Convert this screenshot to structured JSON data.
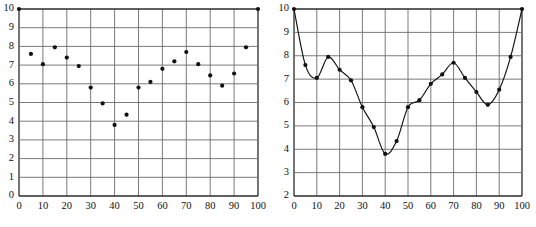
{
  "figure": {
    "title": "",
    "panel_count": 2
  },
  "chart_data": [
    {
      "id": "left-scatter",
      "type": "scatter",
      "title": "",
      "xlabel": "",
      "ylabel": "",
      "xlim": [
        0,
        100
      ],
      "ylim": [
        0,
        10
      ],
      "grid": true,
      "legend": false,
      "xticks": [
        0,
        10,
        20,
        30,
        40,
        50,
        60,
        70,
        80,
        90,
        100
      ],
      "yticks": [
        0,
        1,
        2,
        3,
        4,
        5,
        6,
        7,
        8,
        9,
        10
      ],
      "xticklabels": [
        "0",
        "10",
        "20",
        "30",
        "40",
        "50",
        "60",
        "70",
        "80",
        "90",
        "100"
      ],
      "yticklabels": [
        "0",
        "1",
        "2",
        "3",
        "4",
        "5",
        "6",
        "7",
        "8",
        "9",
        "10"
      ],
      "marker": "filled-circle",
      "marker_color": "#111111",
      "x": [
        0,
        5,
        10,
        15,
        20,
        25,
        30,
        35,
        40,
        45,
        50,
        55,
        60,
        65,
        70,
        75,
        80,
        85,
        90,
        95,
        100
      ],
      "values": [
        10.0,
        7.6,
        7.05,
        7.95,
        7.4,
        6.95,
        5.8,
        4.95,
        3.8,
        4.35,
        5.8,
        6.1,
        6.8,
        7.2,
        7.7,
        7.05,
        6.45,
        5.9,
        6.55,
        7.95,
        10.0
      ]
    },
    {
      "id": "right-line",
      "type": "line",
      "title": "",
      "xlabel": "",
      "ylabel": "",
      "xlim": [
        0,
        100
      ],
      "ylim": [
        2,
        10
      ],
      "grid": true,
      "legend": false,
      "xticks": [
        0,
        10,
        20,
        30,
        40,
        50,
        60,
        70,
        80,
        90,
        100
      ],
      "yticks": [
        2,
        3,
        4,
        5,
        6,
        7,
        8,
        9,
        10
      ],
      "xticklabels": [
        "0",
        "10",
        "20",
        "30",
        "40",
        "50",
        "60",
        "70",
        "80",
        "90",
        "100"
      ],
      "yticklabels": [
        "2",
        "3",
        "4",
        "5",
        "6",
        "7",
        "8",
        "9",
        "10"
      ],
      "marker": "filled-circle",
      "marker_color": "#111111",
      "line_color": "#111111",
      "smoothing": "spline",
      "x": [
        0,
        5,
        10,
        15,
        20,
        25,
        30,
        35,
        40,
        45,
        50,
        55,
        60,
        65,
        70,
        75,
        80,
        85,
        90,
        95,
        100
      ],
      "values": [
        10.0,
        7.6,
        7.05,
        7.95,
        7.4,
        6.95,
        5.8,
        4.95,
        3.8,
        4.35,
        5.8,
        6.1,
        6.8,
        7.2,
        7.7,
        7.05,
        6.45,
        5.9,
        6.55,
        7.95,
        10.0
      ]
    }
  ]
}
